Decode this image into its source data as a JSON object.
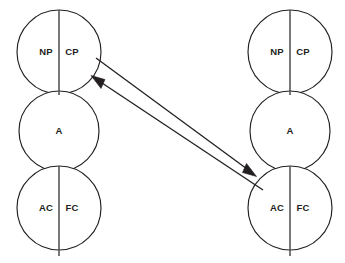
{
  "diagram": {
    "type": "ego-state-transaction",
    "background_color": "#ffffff",
    "stroke_color": "#231f20",
    "divider_color": "#4d4d4f",
    "persons": [
      {
        "id": "person-left",
        "side": "left",
        "center_x": 59,
        "divider_x": 59,
        "divider_top": 10,
        "divider_bottom": 256,
        "ego_states": [
          {
            "id": "left-parent",
            "name": "parent",
            "cy": 52,
            "r": 42,
            "divided": true,
            "left_label": "NP",
            "right_label": "CP",
            "left_label_x": 46,
            "right_label_x": 72
          },
          {
            "id": "left-adult",
            "name": "adult",
            "cy": 131,
            "r": 40,
            "divided": false,
            "center_label": "A"
          },
          {
            "id": "left-child",
            "name": "child",
            "cy": 208,
            "r": 42,
            "divided": true,
            "left_label": "AC",
            "right_label": "FC",
            "left_label_x": 46,
            "right_label_x": 72
          }
        ]
      },
      {
        "id": "person-right",
        "side": "right",
        "center_x": 290,
        "divider_x": 290,
        "divider_top": 10,
        "divider_bottom": 256,
        "ego_states": [
          {
            "id": "right-parent",
            "name": "parent",
            "cy": 52,
            "r": 42,
            "divided": true,
            "left_label": "NP",
            "right_label": "CP",
            "left_label_x": 277,
            "right_label_x": 303
          },
          {
            "id": "right-adult",
            "name": "adult",
            "cy": 131,
            "r": 40,
            "divided": false,
            "center_label": "A"
          },
          {
            "id": "right-child",
            "name": "child",
            "cy": 208,
            "r": 42,
            "divided": true,
            "left_label": "AC",
            "right_label": "FC",
            "left_label_x": 277,
            "right_label_x": 303
          }
        ]
      }
    ],
    "transactions": [
      {
        "id": "transaction-outgoing",
        "label": "",
        "direction": "left-parent-to-right-child",
        "from_x": 96,
        "from_y": 58,
        "to_x": 256,
        "to_y": 176,
        "arrow_at": "end"
      },
      {
        "id": "transaction-incoming",
        "label": "",
        "direction": "right-child-to-left-parent",
        "from_x": 262,
        "from_y": 189,
        "to_x": 92,
        "to_y": 76,
        "arrow_at": "end"
      }
    ]
  }
}
